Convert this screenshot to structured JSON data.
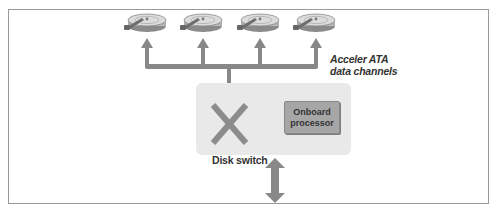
{
  "diagram": {
    "disks": [
      {
        "id": "disk-1",
        "label": ""
      },
      {
        "id": "disk-2",
        "label": ""
      },
      {
        "id": "disk-3",
        "label": ""
      },
      {
        "id": "disk-4",
        "label": ""
      }
    ],
    "channels_label_line1": "Acceler ATA",
    "channels_label_line2": "data channels",
    "switch_label": "Disk switch",
    "processor_label_line1": "Onboard",
    "processor_label_line2": "processor",
    "colors": {
      "arrow": "#888888",
      "controller_box": "#e9e9e9",
      "processor_box": "#a6a6a6",
      "disk_light": "#d8d8d8",
      "disk_dark": "#777777",
      "frame_border": "#9a9a9a"
    }
  }
}
